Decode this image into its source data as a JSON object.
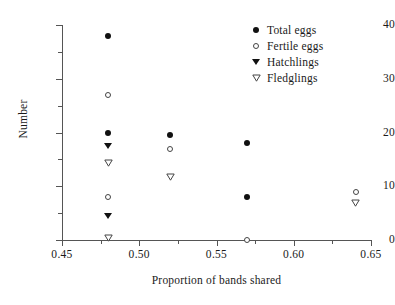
{
  "chart_data": {
    "type": "scatter",
    "title": "",
    "xlabel": "Proportion of bands shared",
    "ylabel": "Number",
    "xlim": [
      0.45,
      0.65
    ],
    "ylim": [
      0,
      40
    ],
    "xticks": [
      "0.45",
      "0.50",
      "0.55",
      "0.60",
      "0.65"
    ],
    "xtick_values": [
      0.45,
      0.5,
      0.55,
      0.6,
      0.65
    ],
    "xminor_values": [
      0.475,
      0.525,
      0.575,
      0.625
    ],
    "yticks": [
      "0",
      "10",
      "20",
      "30",
      "40"
    ],
    "ytick_values": [
      0,
      10,
      20,
      30,
      40
    ],
    "yminor_values": [
      5,
      15,
      25,
      35
    ],
    "grid": false,
    "legend_position": "top-right",
    "series": [
      {
        "name": "Total eggs",
        "marker": "filled-circle",
        "color": "#111111",
        "points": [
          {
            "x": 0.48,
            "y": 38
          },
          {
            "x": 0.48,
            "y": 20
          },
          {
            "x": 0.52,
            "y": 19.5
          },
          {
            "x": 0.57,
            "y": 18
          },
          {
            "x": 0.57,
            "y": 8
          }
        ]
      },
      {
        "name": "Fertile eggs",
        "marker": "open-circle",
        "color": "#444444",
        "points": [
          {
            "x": 0.48,
            "y": 27
          },
          {
            "x": 0.48,
            "y": 8
          },
          {
            "x": 0.52,
            "y": 17
          },
          {
            "x": 0.57,
            "y": 0
          },
          {
            "x": 0.64,
            "y": 9
          }
        ]
      },
      {
        "name": "Hatchlings",
        "marker": "filled-triangle-down",
        "color": "#111111",
        "points": [
          {
            "x": 0.48,
            "y": 17.5
          },
          {
            "x": 0.48,
            "y": 4.5
          }
        ]
      },
      {
        "name": "Fledglings",
        "marker": "open-triangle-down",
        "color": "#444444",
        "points": [
          {
            "x": 0.48,
            "y": 14.5
          },
          {
            "x": 0.48,
            "y": 0.5
          },
          {
            "x": 0.52,
            "y": 12
          },
          {
            "x": 0.64,
            "y": 7
          }
        ]
      }
    ]
  },
  "legend": {
    "items": [
      {
        "label": "Total eggs",
        "marker": "filled-circle"
      },
      {
        "label": "Fertile eggs",
        "marker": "open-circle"
      },
      {
        "label": "Hatchlings",
        "marker": "filled-triangle-down"
      },
      {
        "label": "Fledglings",
        "marker": "open-triangle-down"
      }
    ]
  }
}
